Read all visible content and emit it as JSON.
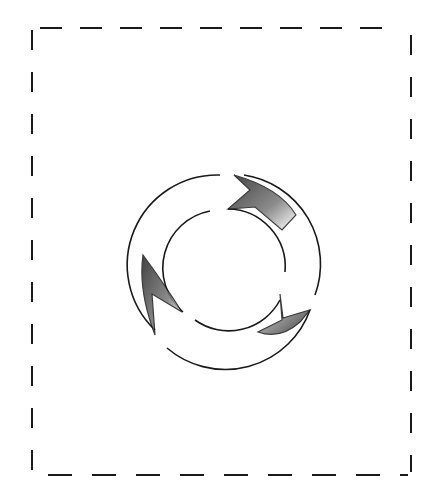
{
  "figure": {
    "frame": {
      "style": "dashed",
      "color": "#1a1a1a"
    },
    "symbol": {
      "name": "circular-arrows-cycle",
      "arrow_count": 2,
      "color": "#1a1a1a",
      "shading": "hatched"
    }
  }
}
